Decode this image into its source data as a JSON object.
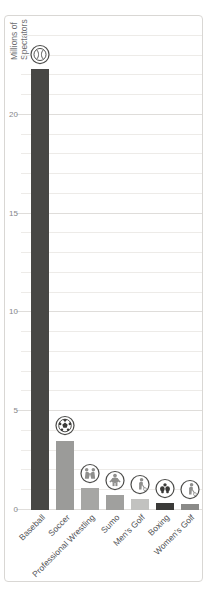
{
  "axis_label": {
    "line1": "Millions of",
    "line2": "Spectators"
  },
  "chart_data": {
    "type": "bar",
    "title": "",
    "xlabel": "",
    "ylabel": "Millions of Spectators",
    "categories": [
      "Baseball",
      "Soccer",
      "Professional Wrestling",
      "Sumo",
      "Men's Golf",
      "Boxing",
      "Women's Golf"
    ],
    "values": [
      22.3,
      3.5,
      1.1,
      0.75,
      0.55,
      0.35,
      0.3
    ],
    "bar_colors": [
      "#474745",
      "#9b9b99",
      "#a6a6a4",
      "#a0a09e",
      "#c2c2c0",
      "#3b3b39",
      "#8a8a88"
    ],
    "icons": [
      "baseball-icon",
      "soccer-ball-icon",
      "wrestling-icon",
      "sumo-icon",
      "golf-icon",
      "boxing-icon",
      "golf-icon"
    ],
    "ylim": [
      0,
      25
    ],
    "yticks": [
      0,
      5,
      10,
      15,
      20
    ],
    "minor_grid_unit": 1,
    "grid": "horizontal",
    "legend": "none"
  },
  "colors": {
    "frame_border": "#d9d7d4",
    "grid_minor": "#edebe8",
    "grid_major": "#dfddda",
    "ytick_text": "#87888a",
    "category_text": "#525356",
    "axis_label_text": "#6d6e71",
    "icon_ring": "#4d4d4b",
    "icon_gray": "#8f8f8d",
    "icon_dark": "#3a3a38",
    "background": "#ffffff"
  }
}
